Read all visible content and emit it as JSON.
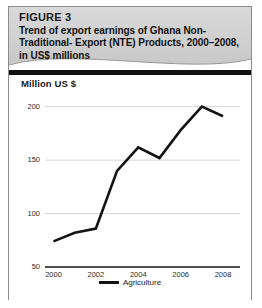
{
  "figure": {
    "label": "FIGURE 3",
    "title_line1": "Trend of export earnings of Ghana Non-",
    "title_line2": "Traditional- Export (NTE) Products, 2000–2008,",
    "title_line3": "in US$ millions",
    "header_bg": "#d2d2d2",
    "border_color": "#8d8d8d",
    "separator_color": "#111111"
  },
  "chart_data": {
    "type": "line",
    "subtitle": "",
    "axis_note": "Million US $",
    "xlabel": "",
    "ylabel": "Million US $",
    "categories": [
      "2000",
      "2001",
      "2002",
      "2003",
      "2004",
      "2005",
      "2006",
      "2007",
      "2008"
    ],
    "x": [
      2000,
      2001,
      2002,
      2003,
      2004,
      2005,
      2006,
      2007,
      2008
    ],
    "xtick_labels": [
      "2000",
      "2002",
      "2004",
      "2006",
      "2008"
    ],
    "xticks": [
      2000,
      2002,
      2004,
      2006,
      2008
    ],
    "ytick_labels": [
      "200",
      "150",
      "100",
      "50"
    ],
    "yticks": [
      200,
      150,
      100,
      50
    ],
    "ylim": [
      50,
      210
    ],
    "xlim": [
      1999.6,
      2008.8
    ],
    "grid": true,
    "grid_color": "#d6d6d6",
    "legend_position": "bottom",
    "series": [
      {
        "name": "Agriculture",
        "color": "#141414",
        "values": [
          74,
          82,
          86,
          140,
          162,
          152,
          178,
          200,
          191
        ]
      }
    ]
  },
  "legend": {
    "items": [
      {
        "label": "Agriculture",
        "color": "#141414"
      }
    ]
  }
}
